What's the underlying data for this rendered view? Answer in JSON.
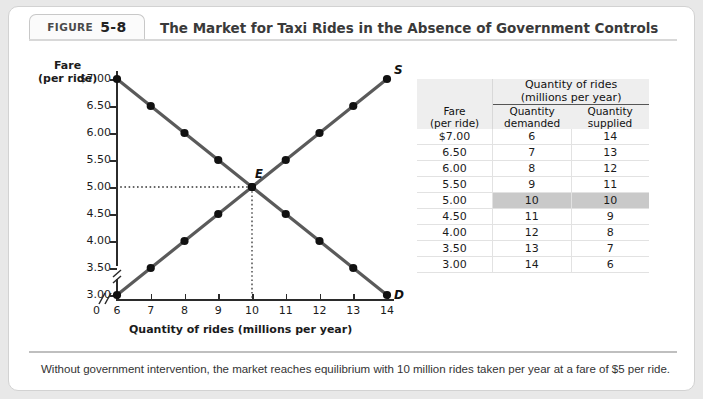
{
  "header": {
    "figure_word": "FIGURE",
    "figure_number": "5-8",
    "title": "The Market for Taxi Rides in the Absence of Government Controls"
  },
  "caption": "Without government intervention, the market reaches equilibrium with 10 million rides taken per year at a fare of $5 per ride.",
  "table": {
    "fare_header_line1": "Fare",
    "fare_header_line2": "(per ride)",
    "group_header_line1": "Quantity of rides",
    "group_header_line2": "(millions per year)",
    "demand_header_line1": "Quantity",
    "demand_header_line2": "demanded",
    "supply_header_line1": "Quantity",
    "supply_header_line2": "supplied",
    "rows": [
      {
        "fare": "$7.00",
        "demanded": "6",
        "supplied": "14",
        "highlight": false
      },
      {
        "fare": "6.50",
        "demanded": "7",
        "supplied": "13",
        "highlight": false
      },
      {
        "fare": "6.00",
        "demanded": "8",
        "supplied": "12",
        "highlight": false
      },
      {
        "fare": "5.50",
        "demanded": "9",
        "supplied": "11",
        "highlight": false
      },
      {
        "fare": "5.00",
        "demanded": "10",
        "supplied": "10",
        "highlight": true
      },
      {
        "fare": "4.50",
        "demanded": "11",
        "supplied": "9",
        "highlight": false
      },
      {
        "fare": "4.00",
        "demanded": "12",
        "supplied": "8",
        "highlight": false
      },
      {
        "fare": "3.50",
        "demanded": "13",
        "supplied": "7",
        "highlight": false
      },
      {
        "fare": "3.00",
        "demanded": "14",
        "supplied": "6",
        "highlight": false
      }
    ]
  },
  "chart_data": {
    "type": "line",
    "title": "The Market for Taxi Rides in the Absence of Government Controls",
    "xlabel": "Quantity of rides (millions per year)",
    "ylabel_line1": "Fare",
    "ylabel_line2": "(per ride)",
    "origin_label": "0",
    "xlim": [
      6,
      14
    ],
    "ylim": [
      3.0,
      7.0
    ],
    "x_ticks": [
      "6",
      "7",
      "8",
      "9",
      "10",
      "11",
      "12",
      "13",
      "14"
    ],
    "y_ticks": [
      "$7.00",
      "6.50",
      "6.00",
      "5.50",
      "5.00",
      "4.50",
      "4.00",
      "3.50",
      "3.00"
    ],
    "axis_break_x": true,
    "axis_break_y": true,
    "grid": false,
    "series": [
      {
        "name": "Demand",
        "label": "D",
        "color": "#5a5a5a",
        "x": [
          6,
          7,
          8,
          9,
          10,
          11,
          12,
          13,
          14
        ],
        "y": [
          7.0,
          6.5,
          6.0,
          5.5,
          5.0,
          4.5,
          4.0,
          3.5,
          3.0
        ]
      },
      {
        "name": "Supply",
        "label": "S",
        "color": "#5a5a5a",
        "x": [
          6,
          7,
          8,
          9,
          10,
          11,
          12,
          13,
          14
        ],
        "y": [
          3.0,
          3.5,
          4.0,
          4.5,
          5.0,
          5.5,
          6.0,
          6.5,
          7.0
        ]
      }
    ],
    "annotations": [
      {
        "label": "E",
        "x": 10,
        "y": 5.0,
        "note": "equilibrium point"
      }
    ],
    "equilibrium": {
      "label": "E",
      "quantity": 10,
      "fare": 5.0
    }
  }
}
